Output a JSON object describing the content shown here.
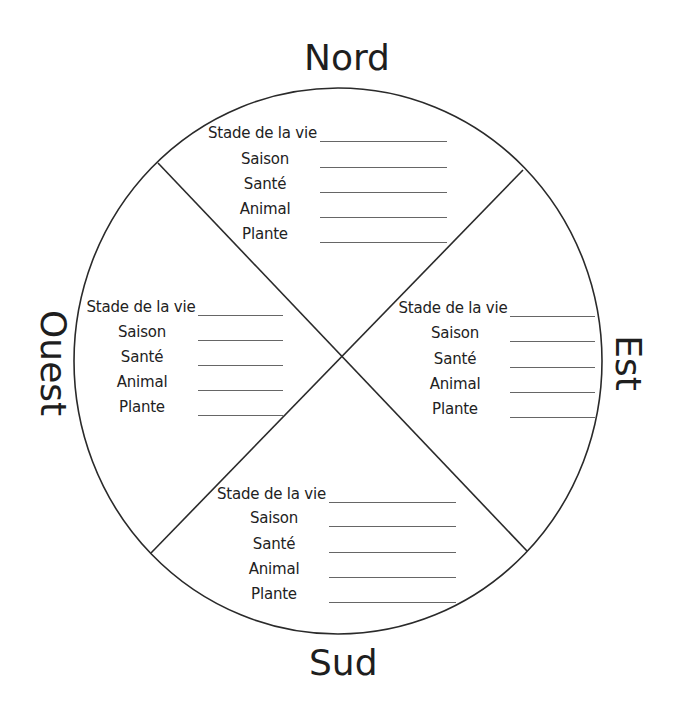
{
  "directions": {
    "north": "Nord",
    "east": "Est",
    "south": "Sud",
    "west": "Ouest"
  },
  "field_labels": [
    "Stade de la vie",
    "Saison",
    "Santé",
    "Animal",
    "Plante"
  ],
  "quadrants": {
    "north": {
      "fields": [
        {
          "label": "Stade de la vie",
          "value": ""
        },
        {
          "label": "Saison",
          "value": ""
        },
        {
          "label": "Santé",
          "value": ""
        },
        {
          "label": "Animal",
          "value": ""
        },
        {
          "label": "Plante",
          "value": ""
        }
      ]
    },
    "west": {
      "fields": [
        {
          "label": "Stade de la vie",
          "value": ""
        },
        {
          "label": "Saison",
          "value": ""
        },
        {
          "label": "Santé",
          "value": ""
        },
        {
          "label": "Animal",
          "value": ""
        },
        {
          "label": "Plante",
          "value": ""
        }
      ]
    },
    "east": {
      "fields": [
        {
          "label": "Stade de la vie",
          "value": ""
        },
        {
          "label": "Saison",
          "value": ""
        },
        {
          "label": "Santé",
          "value": ""
        },
        {
          "label": "Animal",
          "value": ""
        },
        {
          "label": "Plante",
          "value": ""
        }
      ]
    },
    "south": {
      "fields": [
        {
          "label": "Stade de la vie",
          "value": ""
        },
        {
          "label": "Saison",
          "value": ""
        },
        {
          "label": "Santé",
          "value": ""
        },
        {
          "label": "Animal",
          "value": ""
        },
        {
          "label": "Plante",
          "value": ""
        }
      ]
    }
  },
  "colors": {
    "stroke": "#2a2a2a",
    "text": "#222222",
    "underline": "#666666",
    "background": "#ffffff"
  }
}
